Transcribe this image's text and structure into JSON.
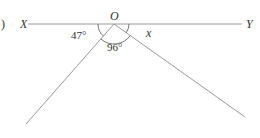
{
  "figure": {
    "part_label": ")",
    "points": {
      "X": {
        "label": "X"
      },
      "Y": {
        "label": "Y"
      },
      "O": {
        "label": "O"
      }
    },
    "angles": [
      {
        "name": "angle-XO-left-ray",
        "label": "47°"
      },
      {
        "name": "angle-between-rays",
        "label": "96°"
      },
      {
        "name": "angle-right-ray-OY",
        "label": "x"
      }
    ],
    "colors": {
      "line": "#9a9a9a",
      "text": "#333333",
      "arc": "#555555"
    }
  }
}
